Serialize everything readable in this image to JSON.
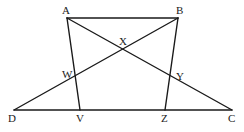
{
  "diagram": {
    "type": "geometry",
    "stroke_color": "#1a1a1a",
    "background": "#ffffff",
    "points": {
      "A": {
        "x": 67,
        "y": 18,
        "label": "A",
        "lx": 62,
        "ly": 14
      },
      "B": {
        "x": 178,
        "y": 18,
        "label": "B",
        "lx": 176,
        "ly": 14
      },
      "C": {
        "x": 232,
        "y": 110,
        "label": "C",
        "lx": 228,
        "ly": 122
      },
      "D": {
        "x": 14,
        "y": 110,
        "label": "D",
        "lx": 8,
        "ly": 122
      },
      "V": {
        "x": 80,
        "y": 110,
        "label": "V",
        "lx": 76,
        "ly": 122
      },
      "Z": {
        "x": 165,
        "y": 110,
        "label": "Z",
        "lx": 161,
        "ly": 122
      },
      "X": {
        "x": 123,
        "y": 49,
        "label": "X",
        "lx": 119,
        "ly": 45
      },
      "W": {
        "x": 76,
        "y": 75,
        "label": "W",
        "lx": 62,
        "ly": 78
      },
      "Y": {
        "x": 170,
        "y": 77,
        "label": "Y",
        "lx": 176,
        "ly": 80
      }
    },
    "segments": [
      [
        "A",
        "B"
      ],
      [
        "D",
        "C"
      ],
      [
        "A",
        "V"
      ],
      [
        "B",
        "Z"
      ],
      [
        "A",
        "C"
      ],
      [
        "B",
        "D"
      ]
    ]
  }
}
